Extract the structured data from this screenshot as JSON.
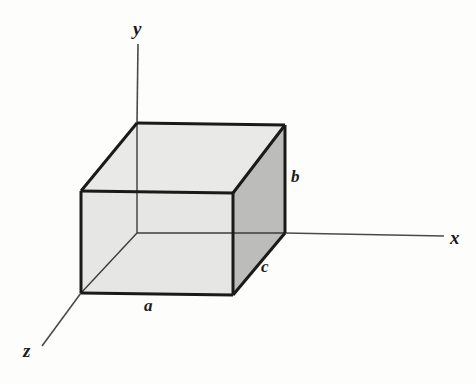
{
  "figure": {
    "background_color": "#fdfdfc",
    "stroke_color": "#1a1a1a",
    "axis_stroke_color": "#4a4a4a",
    "face_color_light": "#e9e9e7",
    "face_color_top": "#eeeeec",
    "face_color_right": "#bcbcba",
    "labels": {
      "axis_x": "x",
      "axis_y": "y",
      "axis_z": "z",
      "edge_a": "a",
      "edge_b": "b",
      "edge_c": "c"
    },
    "geometry": {
      "origin": [
        137,
        233
      ],
      "front_bottom_left": [
        81,
        293
      ],
      "front_bottom_right": [
        233,
        295
      ],
      "front_top_left": [
        81,
        191
      ],
      "front_top_right": [
        233,
        193
      ],
      "back_bottom_right": [
        285,
        233
      ],
      "back_top_left": [
        137,
        123
      ],
      "back_top_right": [
        285,
        125
      ],
      "axis_x_end": [
        444,
        236
      ],
      "axis_y_end": [
        138,
        44
      ],
      "axis_z_end": [
        42,
        346
      ]
    }
  }
}
